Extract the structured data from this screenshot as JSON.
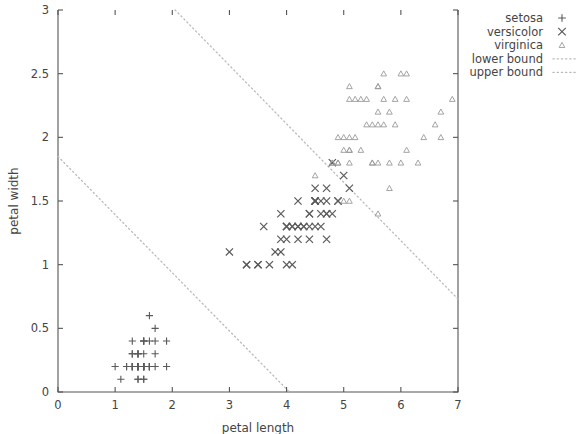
{
  "chart_data": {
    "type": "scatter",
    "title": "",
    "xlabel": "petal length",
    "ylabel": "petal width",
    "xlim": [
      0,
      7
    ],
    "ylim": [
      0,
      3
    ],
    "xticks": [
      "0",
      "1",
      "2",
      "3",
      "4",
      "5",
      "6",
      "7"
    ],
    "xtick_values": [
      0,
      1,
      2,
      3,
      4,
      5,
      6,
      7
    ],
    "yticks": [
      "0",
      "0.5",
      "1",
      "1.5",
      "2",
      "2.5",
      "3"
    ],
    "ytick_values": [
      0,
      0.5,
      1,
      1.5,
      2,
      2.5,
      3
    ],
    "grid": false,
    "legend_position": "upper right outside",
    "marker_color": "#5a5a5a",
    "line_color": "#b9b9b9",
    "axis_color": "#555555",
    "series": [
      {
        "name": "setosa",
        "marker": "plus",
        "points": [
          [
            1.4,
            0.2
          ],
          [
            1.4,
            0.2
          ],
          [
            1.3,
            0.2
          ],
          [
            1.5,
            0.2
          ],
          [
            1.4,
            0.2
          ],
          [
            1.7,
            0.4
          ],
          [
            1.4,
            0.3
          ],
          [
            1.5,
            0.2
          ],
          [
            1.4,
            0.2
          ],
          [
            1.5,
            0.1
          ],
          [
            1.5,
            0.2
          ],
          [
            1.6,
            0.2
          ],
          [
            1.4,
            0.1
          ],
          [
            1.1,
            0.1
          ],
          [
            1.2,
            0.2
          ],
          [
            1.5,
            0.4
          ],
          [
            1.3,
            0.4
          ],
          [
            1.4,
            0.3
          ],
          [
            1.7,
            0.3
          ],
          [
            1.5,
            0.3
          ],
          [
            1.7,
            0.2
          ],
          [
            1.5,
            0.4
          ],
          [
            1.0,
            0.2
          ],
          [
            1.7,
            0.5
          ],
          [
            1.9,
            0.2
          ],
          [
            1.6,
            0.2
          ],
          [
            1.6,
            0.4
          ],
          [
            1.5,
            0.2
          ],
          [
            1.4,
            0.2
          ],
          [
            1.6,
            0.2
          ],
          [
            1.6,
            0.2
          ],
          [
            1.5,
            0.4
          ],
          [
            1.5,
            0.1
          ],
          [
            1.4,
            0.2
          ],
          [
            1.5,
            0.2
          ],
          [
            1.2,
            0.2
          ],
          [
            1.3,
            0.2
          ],
          [
            1.4,
            0.1
          ],
          [
            1.3,
            0.2
          ],
          [
            1.5,
            0.2
          ],
          [
            1.3,
            0.3
          ],
          [
            1.3,
            0.3
          ],
          [
            1.3,
            0.2
          ],
          [
            1.6,
            0.6
          ],
          [
            1.9,
            0.4
          ],
          [
            1.4,
            0.3
          ],
          [
            1.6,
            0.2
          ],
          [
            1.4,
            0.2
          ],
          [
            1.5,
            0.2
          ],
          [
            1.4,
            0.2
          ]
        ]
      },
      {
        "name": "versicolor",
        "marker": "cross",
        "points": [
          [
            4.7,
            1.4
          ],
          [
            4.5,
            1.5
          ],
          [
            4.9,
            1.5
          ],
          [
            4.0,
            1.3
          ],
          [
            4.6,
            1.5
          ],
          [
            4.5,
            1.3
          ],
          [
            4.7,
            1.6
          ],
          [
            3.3,
            1.0
          ],
          [
            4.6,
            1.3
          ],
          [
            3.9,
            1.4
          ],
          [
            3.5,
            1.0
          ],
          [
            4.2,
            1.5
          ],
          [
            4.0,
            1.0
          ],
          [
            4.7,
            1.4
          ],
          [
            3.6,
            1.3
          ],
          [
            4.4,
            1.4
          ],
          [
            4.5,
            1.5
          ],
          [
            4.1,
            1.0
          ],
          [
            4.5,
            1.5
          ],
          [
            3.9,
            1.1
          ],
          [
            4.8,
            1.8
          ],
          [
            4.0,
            1.3
          ],
          [
            4.9,
            1.5
          ],
          [
            4.7,
            1.2
          ],
          [
            4.3,
            1.3
          ],
          [
            4.4,
            1.4
          ],
          [
            4.8,
            1.4
          ],
          [
            5.0,
            1.7
          ],
          [
            4.5,
            1.5
          ],
          [
            3.5,
            1.0
          ],
          [
            3.8,
            1.1
          ],
          [
            3.7,
            1.0
          ],
          [
            3.9,
            1.2
          ],
          [
            5.1,
            1.6
          ],
          [
            4.5,
            1.5
          ],
          [
            4.5,
            1.6
          ],
          [
            4.7,
            1.5
          ],
          [
            4.4,
            1.3
          ],
          [
            4.1,
            1.3
          ],
          [
            4.0,
            1.3
          ],
          [
            4.4,
            1.2
          ],
          [
            4.6,
            1.4
          ],
          [
            4.0,
            1.2
          ],
          [
            3.3,
            1.0
          ],
          [
            4.2,
            1.3
          ],
          [
            4.2,
            1.2
          ],
          [
            4.2,
            1.3
          ],
          [
            4.3,
            1.3
          ],
          [
            3.0,
            1.1
          ],
          [
            4.1,
            1.3
          ]
        ]
      },
      {
        "name": "virginica",
        "marker": "triangle",
        "points": [
          [
            6.0,
            2.5
          ],
          [
            5.1,
            1.9
          ],
          [
            5.9,
            2.1
          ],
          [
            5.6,
            1.8
          ],
          [
            5.8,
            2.2
          ],
          [
            6.6,
            2.1
          ],
          [
            4.5,
            1.7
          ],
          [
            6.3,
            1.8
          ],
          [
            5.8,
            1.8
          ],
          [
            6.1,
            2.5
          ],
          [
            5.1,
            2.0
          ],
          [
            5.3,
            1.9
          ],
          [
            5.5,
            2.1
          ],
          [
            5.0,
            2.0
          ],
          [
            5.1,
            2.4
          ],
          [
            5.3,
            2.3
          ],
          [
            5.5,
            1.8
          ],
          [
            6.7,
            2.2
          ],
          [
            6.9,
            2.3
          ],
          [
            5.0,
            1.5
          ],
          [
            5.7,
            2.3
          ],
          [
            4.9,
            2.0
          ],
          [
            6.7,
            2.0
          ],
          [
            4.9,
            1.8
          ],
          [
            5.7,
            2.1
          ],
          [
            6.0,
            1.8
          ],
          [
            4.8,
            1.8
          ],
          [
            4.9,
            1.8
          ],
          [
            5.6,
            2.1
          ],
          [
            5.8,
            1.6
          ],
          [
            6.1,
            1.9
          ],
          [
            6.4,
            2.0
          ],
          [
            5.6,
            2.2
          ],
          [
            5.1,
            1.5
          ],
          [
            5.6,
            1.4
          ],
          [
            6.1,
            2.3
          ],
          [
            5.6,
            2.4
          ],
          [
            5.5,
            1.8
          ],
          [
            4.8,
            1.8
          ],
          [
            5.4,
            2.1
          ],
          [
            5.6,
            2.4
          ],
          [
            5.1,
            2.3
          ],
          [
            5.1,
            1.9
          ],
          [
            5.9,
            2.3
          ],
          [
            5.7,
            2.5
          ],
          [
            5.2,
            2.3
          ],
          [
            5.0,
            1.9
          ],
          [
            5.2,
            2.0
          ],
          [
            5.4,
            2.3
          ],
          [
            5.1,
            1.8
          ]
        ]
      }
    ],
    "lines": [
      {
        "name": "lower bound",
        "style": "dotted",
        "x0": 0.0,
        "y0": 1.85,
        "x1": 4.05,
        "y1": 0.0
      },
      {
        "name": "upper bound",
        "style": "dotted",
        "x0": 2.05,
        "y0": 3.0,
        "x1": 7.0,
        "y1": 0.73
      }
    ],
    "legend": [
      {
        "label": "setosa",
        "marker": "plus"
      },
      {
        "label": "versicolor",
        "marker": "cross"
      },
      {
        "label": "virginica",
        "marker": "triangle"
      },
      {
        "label": "lower bound",
        "marker": "dotted-line"
      },
      {
        "label": "upper bound",
        "marker": "dotted-line"
      }
    ]
  }
}
